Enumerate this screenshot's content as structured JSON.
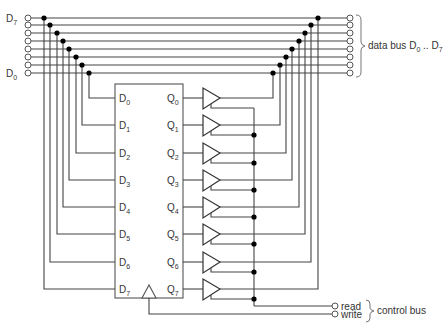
{
  "diagram": {
    "type": "circuit-schematic",
    "data_bus": {
      "left_label_top": "D",
      "left_label_top_sub": "7",
      "left_label_bottom": "D",
      "left_label_bottom_sub": "0",
      "right_label": "data bus D",
      "right_label_sub0": "0",
      "right_label_mid": " .. D",
      "right_label_sub1": "7",
      "lines": 8
    },
    "register": {
      "inputs": [
        {
          "name": "D",
          "sub": "0"
        },
        {
          "name": "D",
          "sub": "1"
        },
        {
          "name": "D",
          "sub": "2"
        },
        {
          "name": "D",
          "sub": "3"
        },
        {
          "name": "D",
          "sub": "4"
        },
        {
          "name": "D",
          "sub": "5"
        },
        {
          "name": "D",
          "sub": "6"
        },
        {
          "name": "D",
          "sub": "7"
        }
      ],
      "outputs": [
        {
          "name": "Q",
          "sub": "0"
        },
        {
          "name": "Q",
          "sub": "1"
        },
        {
          "name": "Q",
          "sub": "2"
        },
        {
          "name": "Q",
          "sub": "3"
        },
        {
          "name": "Q",
          "sub": "4"
        },
        {
          "name": "Q",
          "sub": "5"
        },
        {
          "name": "Q",
          "sub": "6"
        },
        {
          "name": "Q",
          "sub": "7"
        }
      ],
      "clock_symbol": "triangle"
    },
    "buffers": 8,
    "control_bus": {
      "label": "control bus",
      "signals": [
        "read",
        "write"
      ]
    }
  }
}
